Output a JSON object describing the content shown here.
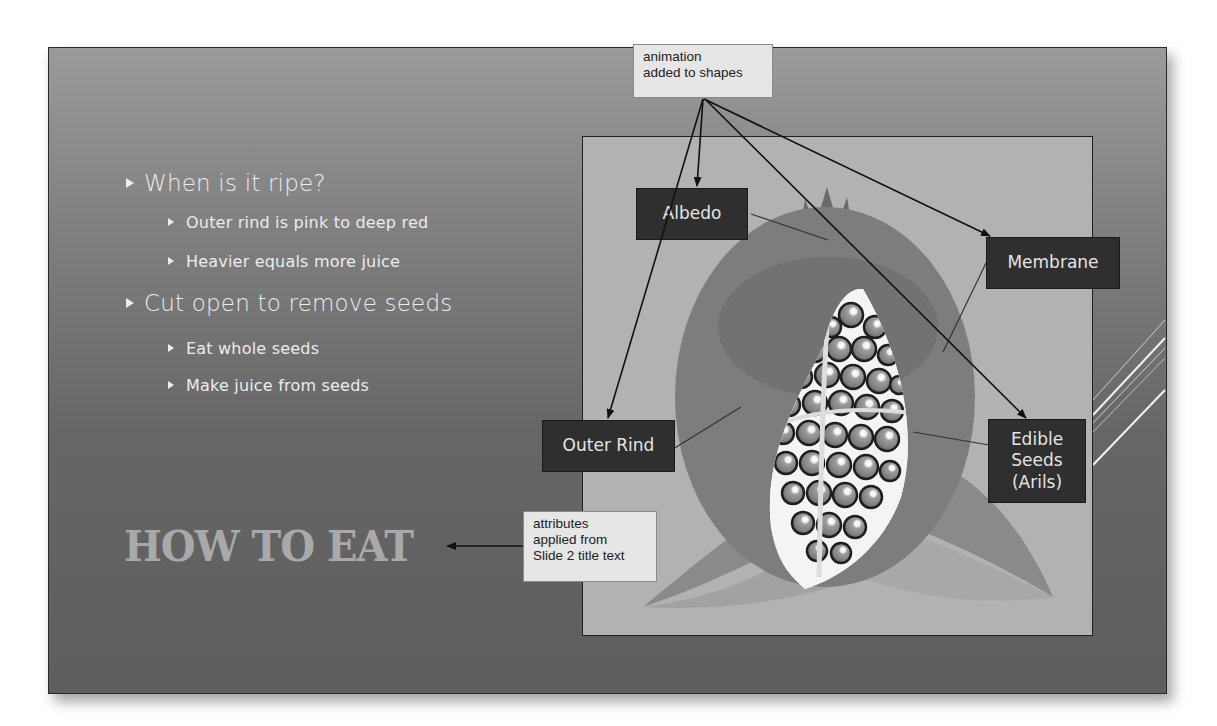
{
  "slide": {
    "title": "HOW TO EAT",
    "bullets": [
      {
        "level": 1,
        "text": "When is it ripe?"
      },
      {
        "level": 2,
        "text": "Outer rind is pink to deep red"
      },
      {
        "level": 2,
        "text": "Heavier equals more juice"
      },
      {
        "level": 1,
        "text": "Cut open to remove seeds"
      },
      {
        "level": 2,
        "text": "Eat whole seeds"
      },
      {
        "level": 2,
        "text": "Make juice from seeds"
      }
    ],
    "diagram_labels": {
      "albedo": "Albedo",
      "membrane": "Membrane",
      "outer_rind": "Outer Rind",
      "edible_seeds_line1": "Edible",
      "edible_seeds_line2": "Seeds",
      "edible_seeds_line3": "(Arils)"
    }
  },
  "callouts": {
    "animation_line1": "animation",
    "animation_line2": "added to shapes",
    "attributes_line1": "attributes",
    "attributes_line2": "applied from",
    "attributes_line3": "Slide 2 title text"
  },
  "colors": {
    "slide_bg_top": "#9a9a9a",
    "slide_bg_bottom": "#5e5e5e",
    "panel_bg": "#b2b2b2",
    "label_bg": "#2f2f2f",
    "title_color": "#a9a9a9",
    "callout_bg": "#e6e6e6"
  }
}
